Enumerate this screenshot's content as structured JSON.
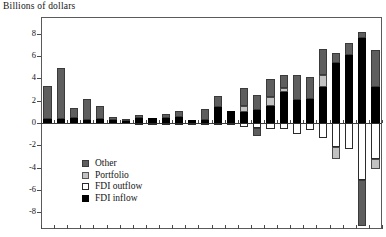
{
  "chart_data": {
    "type": "bar",
    "stacked": true,
    "title": "Billions of dollars",
    "xlabel": "",
    "ylabel": "",
    "ylim": [
      -9.5,
      9.5
    ],
    "yticks": [
      8,
      6,
      4,
      2,
      0,
      -2,
      -4,
      -6,
      -8
    ],
    "ytick_labels": [
      "8",
      "6",
      "4",
      "2",
      "0",
      "-2",
      "-4",
      "-6",
      "-8"
    ],
    "grid": false,
    "legend_position": "inside-lower-left",
    "legend": [
      "Other",
      "Portfolio",
      "FDI outflow",
      "FDI inflow"
    ],
    "colors": {
      "other": "#5e5e5e",
      "portfolio": "#c2c2c2",
      "fdi_outflow": "#ffffff",
      "fdi_inflow": "#000000",
      "axis": "#3c3c3c",
      "frame": "#5a5a5a",
      "text": "#141414"
    },
    "x_tick_count": 26,
    "categories": [
      "1",
      "2",
      "3",
      "4",
      "5",
      "6",
      "7",
      "8",
      "9",
      "10",
      "11",
      "12",
      "13",
      "14",
      "15",
      "16",
      "17",
      "18",
      "19",
      "20",
      "21",
      "22",
      "23",
      "24",
      "25",
      "26"
    ],
    "series": [
      {
        "name": "FDI inflow",
        "key": "fdi_inflow",
        "values": [
          0.35,
          0.4,
          0.45,
          0.25,
          0.35,
          0.3,
          0.15,
          0.45,
          0.45,
          0.45,
          0.55,
          0.3,
          0.3,
          1.45,
          1.1,
          1.0,
          1.15,
          1.55,
          2.8,
          2.1,
          2.15,
          3.2,
          5.35,
          6.05,
          7.6,
          3.25
        ]
      },
      {
        "name": "FDI outflow",
        "key": "fdi_outflow",
        "values": [
          0.0,
          0.0,
          0.0,
          0.0,
          0.0,
          0.0,
          0.0,
          -0.15,
          -0.1,
          -0.05,
          -0.05,
          -0.1,
          -0.1,
          -0.15,
          -0.2,
          -0.35,
          -0.45,
          -0.55,
          -0.55,
          -1.0,
          -0.6,
          -1.35,
          -2.15,
          -2.35,
          -5.1,
          -3.2
        ]
      },
      {
        "name": "Portfolio",
        "key": "portfolio",
        "values": [
          0.0,
          0.0,
          0.0,
          0.0,
          0.0,
          0.0,
          0.0,
          0.0,
          0.0,
          0.0,
          0.0,
          0.0,
          0.0,
          0.0,
          0.0,
          0.55,
          0.0,
          0.75,
          0.3,
          0.0,
          0.0,
          1.1,
          0.0,
          0.0,
          0.0,
          0.0
        ]
      },
      {
        "name": "Portfolio (neg)",
        "key": "portfolio_neg",
        "values": [
          0,
          0,
          0,
          0,
          0,
          0,
          0,
          0,
          0,
          0,
          0,
          0,
          0,
          0,
          0,
          0,
          0,
          0,
          0,
          0,
          0,
          0,
          -1.05,
          0,
          0,
          -0.9
        ]
      },
      {
        "name": "Other",
        "key": "other",
        "values": [
          3.0,
          4.55,
          0.9,
          1.9,
          1.15,
          0.25,
          0.25,
          0.3,
          0.0,
          0.35,
          0.55,
          0.0,
          0.95,
          1.0,
          0.0,
          1.6,
          1.4,
          1.65,
          1.2,
          2.2,
          2.0,
          2.3,
          0.9,
          1.1,
          0.55,
          3.25
        ]
      },
      {
        "name": "Other (neg)",
        "key": "other_neg",
        "values": [
          0,
          0,
          0,
          0,
          0,
          0,
          0,
          0,
          0,
          0,
          0,
          0,
          0,
          0,
          0,
          0,
          -0.75,
          0,
          0,
          0,
          0,
          0,
          0,
          0,
          -4.1,
          0
        ]
      }
    ]
  },
  "legend_items": [
    {
      "label": "Other",
      "swatch": "other"
    },
    {
      "label": "Portfolio",
      "swatch": "portfolio"
    },
    {
      "label": "FDI outflow",
      "swatch": "outflow"
    },
    {
      "label": "FDI inflow",
      "swatch": "inflow"
    }
  ]
}
